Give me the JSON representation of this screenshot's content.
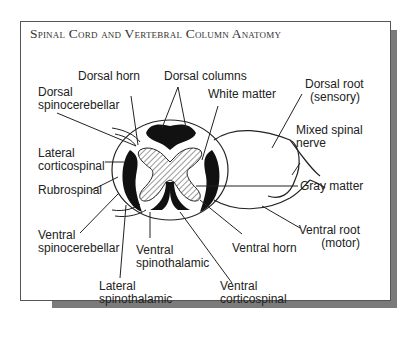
{
  "title": "Spinal Cord and Vertebral Column Anatomy",
  "labels": {
    "dorsal_horn": "Dorsal horn",
    "dorsal_columns": "Dorsal columns",
    "dorsal_root_1": "Dorsal root",
    "dorsal_root_2": "(sensory)",
    "dorsal_spinocerebellar_1": "Dorsal",
    "dorsal_spinocerebellar_2": "spinocerebellar",
    "white_matter": "White matter",
    "mixed_spinal_nerve_1": "Mixed spinal",
    "mixed_spinal_nerve_2": "nerve",
    "lateral_corticospinal_1": "Lateral",
    "lateral_corticospinal_2": "corticospinal",
    "rubrospinal": "Rubrospinal",
    "gray_matter": "Gray matter",
    "ventral_spinocerebellar_1": "Ventral",
    "ventral_spinocerebellar_2": "spinocerebellar",
    "ventral_spinothalamic_1": "Ventral",
    "ventral_spinothalamic_2": "spinothalamic",
    "ventral_horn": "Ventral horn",
    "ventral_root_1": "Ventral root",
    "ventral_root_2": "(motor)",
    "lateral_spinothalamic_1": "Lateral",
    "lateral_spinothalamic_2": "spinothalamic",
    "ventral_corticospinal_1": "Ventral",
    "ventral_corticospinal_2": "corticospinal"
  }
}
